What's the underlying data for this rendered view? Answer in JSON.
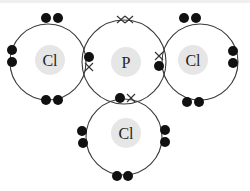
{
  "atoms": [
    {
      "id": "cl-left",
      "symbol": "Cl"
    },
    {
      "id": "p-center",
      "symbol": "P"
    },
    {
      "id": "cl-right",
      "symbol": "Cl"
    },
    {
      "id": "cl-bottom",
      "symbol": "Cl"
    }
  ],
  "legend": {
    "dot": "electron from Cl",
    "cross": "electron from P"
  },
  "colors": {
    "shell": "#3a3a3a",
    "nucleus": "#e6e6e6",
    "electron": "#111111"
  }
}
